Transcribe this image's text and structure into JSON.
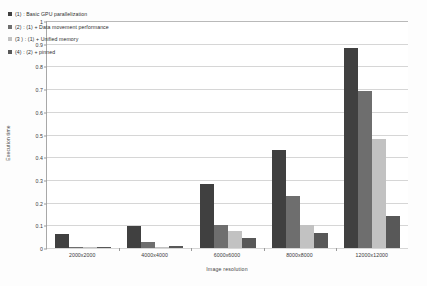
{
  "chart_data": {
    "type": "bar",
    "title": "",
    "xlabel": "Image resolution",
    "ylabel": "Execution time",
    "categories": [
      "2000x2000",
      "4000x4000",
      "6000x6000",
      "8000x8000",
      "12000x12000"
    ],
    "ylim": [
      0,
      1
    ],
    "yticks": [
      "0",
      "0.1",
      "0.2",
      "0.3",
      "0.4",
      "0.5",
      "0.6",
      "0.7",
      "0.8",
      "0.9",
      "1"
    ],
    "grid": "horizontal",
    "legend_position": "top-left",
    "series": [
      {
        "name": "(1) : Basic GPU parallelization",
        "color": "#404040",
        "values": [
          0.06,
          0.095,
          0.28,
          0.43,
          0.88
        ]
      },
      {
        "name": "(2) : (1) + Data movement performance",
        "color": "#6e6e6e",
        "values": [
          0.006,
          0.025,
          0.1,
          0.23,
          0.69
        ]
      },
      {
        "name": "(3 ) : (1) + Unified memory",
        "color": "#c2c2c2",
        "values": [
          0.004,
          0.006,
          0.075,
          0.1,
          0.48
        ]
      },
      {
        "name": "(4) : (2) + pinned",
        "color": "#585858",
        "values": [
          0.003,
          0.008,
          0.045,
          0.068,
          0.14
        ]
      }
    ]
  }
}
